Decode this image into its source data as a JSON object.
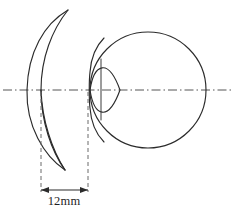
{
  "figure": {
    "background_color": "#ffffff",
    "line_color": "#2b2b2b",
    "axis_color": "#555555",
    "extension_line_color": "#6a6a6a"
  },
  "dimension": {
    "label": "12mm",
    "value": 12,
    "unit": "mm",
    "from_x": 41,
    "to_x": 88,
    "line_y": 190,
    "text_x": 64,
    "text_y": 205
  },
  "optical_axis": {
    "y": 90,
    "x_start": 3,
    "x_end": 231,
    "style": "dash-dot"
  },
  "lens": {
    "name": "contact-lens-crescent",
    "top_tip_x": 68,
    "top_tip_y": 10,
    "bottom_tip_x": 65,
    "bottom_tip_y": 170,
    "outer_edge_x_at_axis": 27,
    "inner_edge_x_at_axis": 41
  },
  "eyeball": {
    "name": "eyeball-sphere",
    "center_x": 148,
    "center_y": 90,
    "radius": 58,
    "top_y": 31,
    "bottom_y": 148,
    "right_x": 206
  },
  "cornea": {
    "name": "cornea-lens-shape",
    "apex_x": 90,
    "base_x": 120,
    "top_y": 62,
    "bottom_y": 118
  },
  "limbus": {
    "name": "limbus-line",
    "x": 101,
    "top_y": 59,
    "bottom_y": 120
  },
  "extension_lines": [
    {
      "name": "lens-extension-line",
      "x": 41,
      "y_top": 92,
      "y_bottom": 192
    },
    {
      "name": "cornea-extension-line",
      "x": 88,
      "y_top": 92,
      "y_bottom": 192
    }
  ]
}
